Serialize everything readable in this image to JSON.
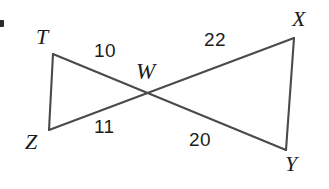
{
  "figure": {
    "type": "geometry-diagram",
    "stroke_color": "#4a4a4a",
    "background_color": "#ffffff",
    "text_color": "#1c1c1c",
    "vertices": [
      {
        "id": "T",
        "label": "T",
        "x": 53,
        "y": 54
      },
      {
        "id": "Z",
        "label": "Z",
        "x": 49,
        "y": 130
      },
      {
        "id": "W",
        "label": "W",
        "x": 146,
        "y": 92
      },
      {
        "id": "X",
        "label": "X",
        "x": 294,
        "y": 38
      },
      {
        "id": "Y",
        "label": "Y",
        "x": 286,
        "y": 150
      }
    ],
    "segments": [
      {
        "id": "TZ",
        "from": "T",
        "to": "Z",
        "measure": null
      },
      {
        "id": "TY",
        "from": "T",
        "to": "Y",
        "measure": null
      },
      {
        "id": "ZX",
        "from": "Z",
        "to": "X",
        "measure": null
      },
      {
        "id": "XY",
        "from": "X",
        "to": "Y",
        "measure": null
      }
    ],
    "measures": [
      {
        "id": "TW",
        "segment": "TW",
        "value": "10",
        "x": 94,
        "y": 41
      },
      {
        "id": "ZW",
        "segment": "ZW",
        "value": "11",
        "x": 94,
        "y": 117
      },
      {
        "id": "WX",
        "segment": "WX",
        "value": "22",
        "x": 204,
        "y": 30
      },
      {
        "id": "WY",
        "segment": "WY",
        "value": "20",
        "x": 189,
        "y": 130
      }
    ],
    "labels": {
      "t": "T",
      "z": "Z",
      "w": "W",
      "x": "X",
      "y": "Y",
      "tw": "10",
      "zw": "11",
      "wx": "22",
      "wy": "20"
    }
  }
}
